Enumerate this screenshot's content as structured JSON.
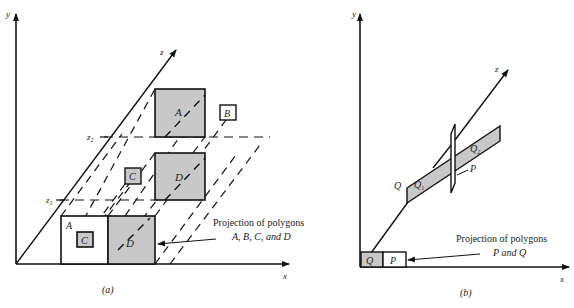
{
  "figures": [
    {
      "id": "a",
      "caption": "(a)",
      "axes": {
        "x": "x",
        "y": "y",
        "z": "z"
      },
      "depth_markers": [
        "z1",
        "z2"
      ],
      "polygons_in_space": [
        {
          "label": "A",
          "fill": "#c8c8c8"
        },
        {
          "label": "B",
          "fill": "#ffffff"
        },
        {
          "label": "C",
          "fill": "#c8c8c8"
        },
        {
          "label": "D",
          "fill": "#c8c8c8"
        }
      ],
      "projections": [
        {
          "label": "A",
          "fill": "#ffffff"
        },
        {
          "label": "C",
          "fill": "#c8c8c8"
        },
        {
          "label": "D",
          "fill": "#c8c8c8"
        }
      ],
      "annotation_line1": "Projection of polygons",
      "annotation_line2": "A, B, C, and D"
    },
    {
      "id": "b",
      "caption": "(b)",
      "axes": {
        "x": "x",
        "y": "y",
        "z": "z"
      },
      "polygons_in_space": [
        {
          "label": "Q",
          "fill": "#c8c8c8"
        },
        {
          "label": "Q1",
          "fill": "#c8c8c8"
        },
        {
          "label": "Q2",
          "fill": "#c8c8c8"
        },
        {
          "label": "P",
          "fill": "#ffffff"
        }
      ],
      "projections": [
        {
          "label": "Q",
          "fill": "#c8c8c8"
        },
        {
          "label": "P",
          "fill": "#ffffff"
        }
      ],
      "annotation_line1": "Projection of polygons",
      "annotation_line2": "P and Q"
    }
  ],
  "colors": {
    "stroke": "#111111",
    "shade": "#c8c8c8",
    "background": "#ffffff"
  }
}
